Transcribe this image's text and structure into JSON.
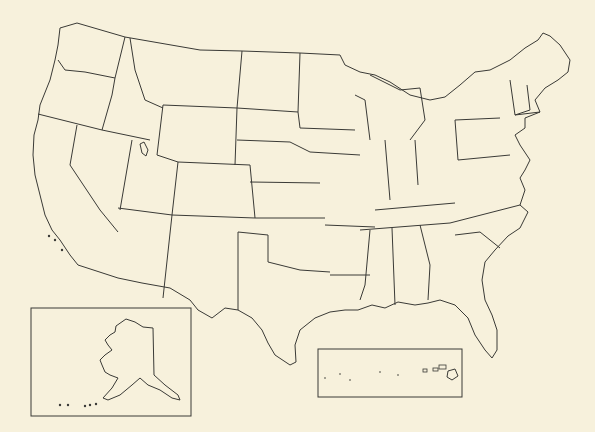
{
  "map": {
    "title": "",
    "type": "blank outline map",
    "region": "United States",
    "background_color": "#f7f1dc",
    "stroke_color": "#3a3a36",
    "labels": [],
    "insets": [
      {
        "name": "Alaska",
        "frame": {
          "x": 31,
          "y": 308,
          "w": 160,
          "h": 108
        }
      },
      {
        "name": "Hawaii",
        "frame": {
          "x": 318,
          "y": 349,
          "w": 144,
          "h": 48
        }
      }
    ]
  }
}
